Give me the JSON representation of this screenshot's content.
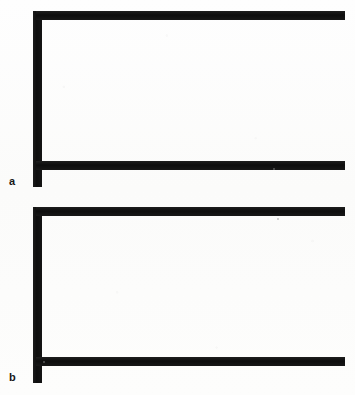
{
  "figure": {
    "background_color": "#fdfdfc",
    "ink_color": "#161616",
    "width": 355,
    "height": 395,
    "panels": [
      {
        "id": "a",
        "label": "a",
        "label_x": 9,
        "label_y": 176,
        "vertical_bar": {
          "x": 33,
          "y": 11,
          "width": 9,
          "height": 176
        },
        "top_bar": {
          "x": 36,
          "y": 11,
          "width": 309,
          "height": 9
        },
        "bottom_bar": {
          "x": 36,
          "y": 161,
          "width": 309,
          "height": 9
        }
      },
      {
        "id": "b",
        "label": "b",
        "label_x": 9,
        "label_y": 372,
        "vertical_bar": {
          "x": 33,
          "y": 207,
          "width": 9,
          "height": 176
        },
        "top_bar": {
          "x": 36,
          "y": 207,
          "width": 309,
          "height": 9
        },
        "bottom_bar": {
          "x": 36,
          "y": 357,
          "width": 309,
          "height": 9
        }
      }
    ],
    "specks": [
      {
        "x": 273,
        "y": 168,
        "size": 2
      },
      {
        "x": 277,
        "y": 218,
        "size": 2
      },
      {
        "x": 43,
        "y": 361,
        "size": 2
      }
    ]
  }
}
